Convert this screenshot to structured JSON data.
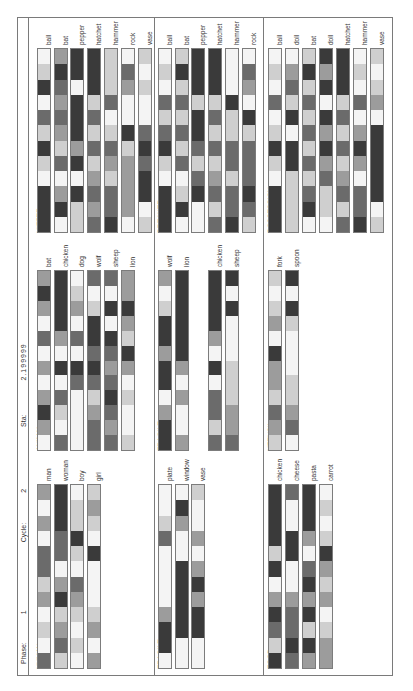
{
  "header": {
    "phase_label": "Phase:",
    "phase_value": "1",
    "cycle_label": "Cycle:",
    "cycle_value": "2",
    "sta_label": "Sta:",
    "sta_value": "2.199999"
  },
  "gray_levels": [
    "#f4f4f4",
    "#cfcfcf",
    "#9c9c9c",
    "#6b6b6b",
    "#3a3a3a"
  ],
  "chart_data": {
    "type": "heatmap",
    "title": "Phase: 1  Cycle: 2  Sta: 2.199999",
    "orientation": "rotated 90° counter-clockwise",
    "cells_per_unit": 12,
    "value_scale": "0 = white (low) … 4 = black (high)",
    "panels": [
      {
        "name": "HITTER",
        "units": [
          {
            "label": "ball",
            "values": [
              0,
              1,
              4,
              0,
              3,
              1,
              4,
              1,
              0,
              4,
              4,
              4
            ]
          },
          {
            "label": "bat",
            "values": [
              2,
              4,
              3,
              2,
              3,
              2,
              1,
              3,
              0,
              2,
              4,
              0
            ]
          },
          {
            "label": "pepper",
            "values": [
              4,
              4,
              0,
              4,
              4,
              4,
              2,
              4,
              0,
              4,
              1,
              1
            ]
          },
          {
            "label": "hatchet",
            "values": [
              4,
              4,
              4,
              1,
              3,
              1,
              3,
              1,
              2,
              3,
              2,
              3
            ]
          },
          {
            "label": "hammer",
            "values": [
              1,
              1,
              1,
              3,
              0,
              1,
              3,
              2,
              1,
              3,
              3,
              4
            ]
          },
          {
            "label": "rock",
            "values": [
              0,
              3,
              2,
              0,
              0,
              4,
              1,
              2,
              2,
              2,
              2,
              0
            ]
          },
          {
            "label": "vase",
            "values": [
              1,
              0,
              1,
              0,
              0,
              3,
              4,
              3,
              4,
              4,
              0,
              1
            ]
          }
        ]
      },
      {
        "name": "BREAKER",
        "units": [
          {
            "label": "ball",
            "values": [
              0,
              1,
              0,
              3,
              1,
              3,
              4,
              1,
              0,
              4,
              4,
              4
            ]
          },
          {
            "label": "bat",
            "values": [
              1,
              4,
              1,
              3,
              1,
              3,
              1,
              3,
              0,
              1,
              4,
              0
            ]
          },
          {
            "label": "pepper",
            "values": [
              4,
              4,
              4,
              1,
              4,
              4,
              3,
              1,
              3,
              4,
              0,
              0
            ]
          },
          {
            "label": "hatchet",
            "values": [
              4,
              4,
              4,
              1,
              3,
              1,
              3,
              1,
              2,
              3,
              1,
              3
            ]
          },
          {
            "label": "hammer",
            "values": [
              0,
              0,
              0,
              4,
              1,
              1,
              3,
              3,
              1,
              3,
              3,
              4
            ]
          },
          {
            "label": "rock",
            "values": [
              0,
              3,
              2,
              0,
              4,
              1,
              3,
              3,
              3,
              4,
              3,
              1
            ]
          }
        ]
      },
      {
        "name": "POSSESSION",
        "units": [
          {
            "label": "ball",
            "values": [
              0,
              1,
              0,
              3,
              0,
              1,
              4,
              1,
              0,
              4,
              4,
              4
            ]
          },
          {
            "label": "doll",
            "values": [
              0,
              2,
              3,
              1,
              4,
              0,
              4,
              4,
              1,
              1,
              1,
              1
            ]
          },
          {
            "label": "bat",
            "values": [
              1,
              4,
              1,
              3,
              1,
              3,
              1,
              3,
              1,
              3,
              4,
              0
            ]
          },
          {
            "label": "doll",
            "values": [
              4,
              2,
              4,
              0,
              4,
              2,
              4,
              2,
              3,
              1,
              1,
              0
            ]
          },
          {
            "label": "hatchet",
            "values": [
              4,
              4,
              4,
              1,
              3,
              1,
              3,
              1,
              2,
              3,
              1,
              3
            ]
          },
          {
            "label": "hammer",
            "values": [
              0,
              1,
              0,
              3,
              0,
              2,
              4,
              2,
              0,
              3,
              3,
              4
            ]
          },
          {
            "label": "vase",
            "values": [
              1,
              0,
              1,
              2,
              0,
              4,
              4,
              4,
              4,
              4,
              0,
              1
            ]
          }
        ]
      },
      {
        "name": "ANIMAL",
        "units": [
          {
            "label": "bat",
            "values": [
              2,
              4,
              2,
              0,
              3,
              0,
              2,
              0,
              2,
              4,
              2,
              0
            ]
          },
          {
            "label": "chicken",
            "values": [
              4,
              4,
              4,
              4,
              2,
              0,
              4,
              0,
              3,
              1,
              0,
              3
            ]
          },
          {
            "label": "dog",
            "values": [
              0,
              1,
              2,
              0,
              3,
              0,
              4,
              3,
              0,
              0,
              0,
              0
            ]
          },
          {
            "label": "wolf",
            "values": [
              3,
              0,
              1,
              4,
              4,
              3,
              4,
              3,
              1,
              2,
              3,
              3
            ]
          },
          {
            "label": "sheep",
            "values": [
              3,
              0,
              4,
              0,
              4,
              3,
              2,
              3,
              4,
              3,
              2,
              3
            ]
          },
          {
            "label": "lion",
            "values": [
              2,
              2,
              4,
              2,
              1,
              4,
              2,
              0,
              1,
              0,
              0,
              1
            ]
          }
        ]
      },
      {
        "name": "FRAGILE",
        "units": [
          {
            "label": "wolf",
            "values": [
              2,
              0,
              1,
              4,
              4,
              2,
              4,
              4,
              0,
              2,
              4,
              4
            ]
          },
          {
            "label": "lion",
            "values": [
              4,
              4,
              4,
              4,
              4,
              4,
              2,
              0,
              2,
              0,
              0,
              2
            ]
          },
          {
            "label": "chicken",
            "values": [
              4,
              4,
              4,
              4,
              2,
              0,
              4,
              0,
              3,
              3,
              1,
              3
            ]
          },
          {
            "label": "sheep",
            "values": [
              4,
              0,
              4,
              0,
              0,
              0,
              1,
              1,
              1,
              2,
              2,
              3
            ]
          }
        ]
      },
      {
        "name": "UTENSIL",
        "units": [
          {
            "label": "fork",
            "values": [
              1,
              0,
              1,
              2,
              0,
              4,
              2,
              2,
              1,
              3,
              2,
              1
            ]
          },
          {
            "label": "spoon",
            "values": [
              4,
              0,
              4,
              1,
              0,
              0,
              0,
              1,
              1,
              2,
              3,
              0
            ]
          }
        ]
      },
      {
        "name": "HUMAN",
        "units": [
          {
            "label": "man",
            "values": [
              2,
              0,
              2,
              0,
              3,
              3,
              1,
              2,
              0,
              1,
              0,
              3
            ]
          },
          {
            "label": "woman",
            "values": [
              4,
              4,
              4,
              3,
              3,
              0,
              2,
              4,
              1,
              2,
              3,
              1
            ]
          },
          {
            "label": "boy",
            "values": [
              0,
              1,
              1,
              4,
              1,
              0,
              3,
              2,
              1,
              0,
              1,
              0
            ]
          },
          {
            "label": "girl",
            "values": [
              1,
              2,
              1,
              0,
              4,
              0,
              0,
              0,
              1,
              2,
              0,
              2
            ]
          }
        ]
      },
      {
        "name": "FRAGILE",
        "units": [
          {
            "label": "plate",
            "values": [
              0,
              0,
              1,
              3,
              0,
              0,
              0,
              0,
              2,
              4,
              4,
              0
            ]
          },
          {
            "label": "window",
            "values": [
              0,
              4,
              2,
              0,
              0,
              4,
              4,
              4,
              4,
              4,
              0,
              0
            ]
          },
          {
            "label": "vase",
            "values": [
              1,
              0,
              0,
              2,
              0,
              2,
              4,
              2,
              4,
              4,
              0,
              0
            ]
          }
        ]
      },
      {
        "name": "FOOD",
        "units": [
          {
            "label": "chicken",
            "values": [
              4,
              4,
              4,
              4,
              1,
              4,
              0,
              2,
              4,
              3,
              1,
              4
            ]
          },
          {
            "label": "cheese",
            "values": [
              3,
              0,
              0,
              4,
              4,
              0,
              0,
              2,
              3,
              3,
              4,
              3
            ]
          },
          {
            "label": "pasta",
            "values": [
              4,
              4,
              4,
              2,
              0,
              3,
              4,
              2,
              4,
              1,
              4,
              2
            ]
          },
          {
            "label": "carrot",
            "values": [
              0,
              1,
              0,
              1,
              4,
              2,
              1,
              2,
              0,
              1,
              2,
              2
            ]
          }
        ]
      }
    ]
  },
  "layout": {
    "panels": [
      {
        "x": 19,
        "top": 30,
        "bottom": 215,
        "xs": [
          19,
          36,
          52,
          69,
          86,
          103,
          120
        ]
      },
      {
        "x": 140,
        "top": 30,
        "bottom": 215,
        "xs": [
          140,
          157,
          173,
          190,
          207,
          224
        ]
      },
      {
        "x": 250,
        "top": 30,
        "bottom": 215,
        "xs": [
          250,
          267,
          284,
          301,
          318,
          335,
          352
        ]
      },
      {
        "x": 19,
        "top": 252,
        "bottom": 433,
        "xs": [
          19,
          36,
          52,
          69,
          86,
          103
        ]
      },
      {
        "x": 140,
        "top": 252,
        "bottom": 433,
        "xs": [
          140,
          157,
          190,
          207
        ]
      },
      {
        "x": 250,
        "top": 252,
        "bottom": 433,
        "xs": [
          250,
          267
        ]
      },
      {
        "x": 19,
        "top": 466,
        "bottom": 651,
        "xs": [
          19,
          36,
          52,
          69
        ]
      },
      {
        "x": 140,
        "top": 466,
        "bottom": 651,
        "xs": [
          140,
          157,
          173
        ]
      },
      {
        "x": 250,
        "top": 466,
        "bottom": 651,
        "xs": [
          250,
          267,
          284,
          301
        ]
      }
    ]
  }
}
